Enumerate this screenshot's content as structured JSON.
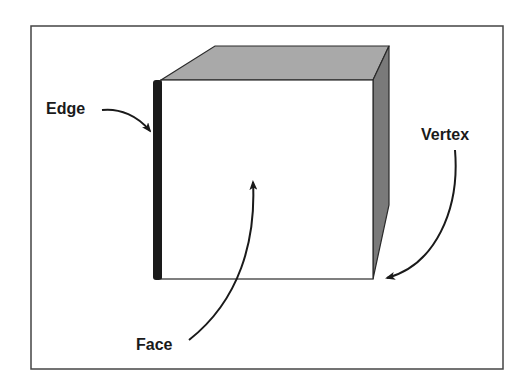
{
  "diagram": {
    "labels": {
      "edge": "Edge",
      "vertex": "Vertex",
      "face": "Face"
    },
    "colors": {
      "frame": "#444444",
      "outline": "#2a2a2a",
      "top_face": "#a9a9a9",
      "side_face": "#7a7a7a",
      "front_face": "#ffffff",
      "edge_highlight": "#1a1a1a",
      "arrow": "#1a1a1a"
    }
  }
}
